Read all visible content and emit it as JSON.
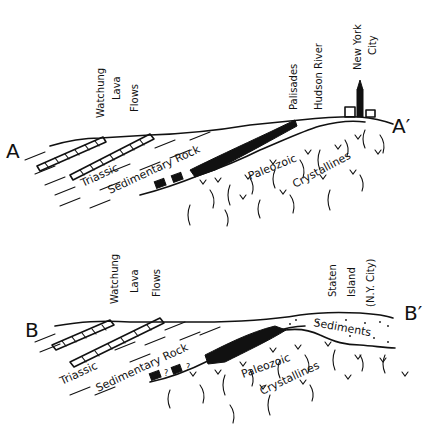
{
  "sections": [
    {
      "id": "A",
      "left_marker": "A",
      "right_marker": "A′",
      "labels": {
        "watchung": [
          "Watchung",
          "Lava",
          "Flows"
        ],
        "palisades": "Palisades",
        "hudson": "Hudson River",
        "nyc": [
          "New York",
          "City"
        ],
        "triassic": "Triassic",
        "sedimentary": "Sedimentary Rock",
        "paleozoic": "Paleozoic",
        "crystallines": "Crystallines"
      }
    },
    {
      "id": "B",
      "left_marker": "B",
      "right_marker": "B′",
      "labels": {
        "watchung": [
          "Watchung",
          "Lava",
          "Flows"
        ],
        "staten": [
          "Staten",
          "Island",
          "(N.Y. City)"
        ],
        "triassic": "Triassic",
        "sedimentary": "Sedimentary Rock",
        "uncertain": "?",
        "sediments": "Sediments",
        "paleozoic": "Paleozoic",
        "crystallines": "Crystallines"
      }
    }
  ]
}
